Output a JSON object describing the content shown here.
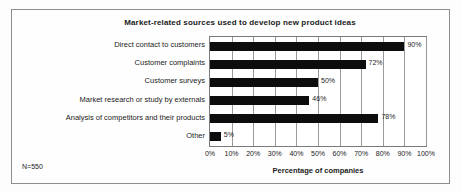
{
  "figure": {
    "note": "N=550",
    "frame_color": "#8d8d8d",
    "bar_color": "#0d0d0d"
  },
  "chart_data": {
    "type": "bar",
    "orientation": "horizontal",
    "title": "Market-related sources used to develop new product ideas",
    "xlabel": "Percentage  of companies",
    "ylabel": "",
    "categories": [
      "Direct contact to customers",
      "Customer complaints",
      "Customer surveys",
      "Market research or study by externals",
      "Analysis of competitors and their products",
      "Other"
    ],
    "values": [
      90,
      72,
      50,
      46,
      78,
      5
    ],
    "value_labels": [
      "90%",
      "72%",
      "50%",
      "46%",
      "78%",
      "5%"
    ],
    "xlim": [
      0,
      100
    ],
    "xticks": [
      0,
      10,
      20,
      30,
      40,
      50,
      60,
      70,
      80,
      90,
      100
    ],
    "xtick_labels": [
      "0%",
      "10%",
      "20%",
      "30%",
      "40%",
      "50%",
      "60%",
      "70%",
      "80%",
      "90%",
      "100%"
    ],
    "grid": true,
    "grid_axis": "x",
    "legend": "none",
    "annotations": [
      "N=550"
    ]
  }
}
